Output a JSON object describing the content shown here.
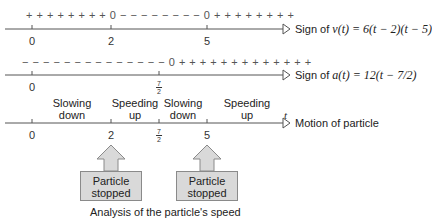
{
  "lines": [
    {
      "id": "velocity",
      "signs_left": "+ + + + + + + + 0 − − − − − − − − 0 + + + + + + + +",
      "ticks": [
        {
          "label": "0",
          "x": 32
        },
        {
          "label": "2",
          "x": 111
        },
        {
          "label": "5",
          "x": 207
        }
      ],
      "label_prefix": "Sign of ",
      "label_math": "v(t) = 6(t − 2)(t − 5)"
    },
    {
      "id": "acceleration",
      "signs_left": "− − − − − − − − − − − − − − 0 + + + + + + + + + + + + +",
      "ticks": [
        {
          "label": "0",
          "x": 32
        },
        {
          "label": "7/2",
          "x": 159,
          "numerator": "7",
          "denominator": "2"
        }
      ],
      "label_prefix": "Sign of ",
      "label_math": "a(t) = 12(t − 7/2)"
    },
    {
      "id": "motion",
      "axis_var": "t",
      "ticks": [
        {
          "label": "0",
          "x": 32
        },
        {
          "label": "2",
          "x": 111
        },
        {
          "label": "7/2",
          "x": 159,
          "numerator": "7",
          "denominator": "2"
        },
        {
          "label": "5",
          "x": 207
        }
      ],
      "phases": [
        {
          "line1": "Slowing",
          "line2": "down"
        },
        {
          "line1": "Speeding",
          "line2": "up"
        },
        {
          "line1": "Slowing",
          "line2": "down"
        },
        {
          "line1": "Speeding",
          "line2": "up"
        }
      ],
      "label": "Motion of particle"
    }
  ],
  "callouts": [
    {
      "line1": "Particle",
      "line2": "stopped",
      "at": "2"
    },
    {
      "line1": "Particle",
      "line2": "stopped",
      "at": "5"
    }
  ],
  "caption": "Analysis of the particle's speed",
  "colors": {
    "axis": "#555555",
    "box_fill": "#d9d9d9",
    "box_border": "#8a8a8a"
  }
}
